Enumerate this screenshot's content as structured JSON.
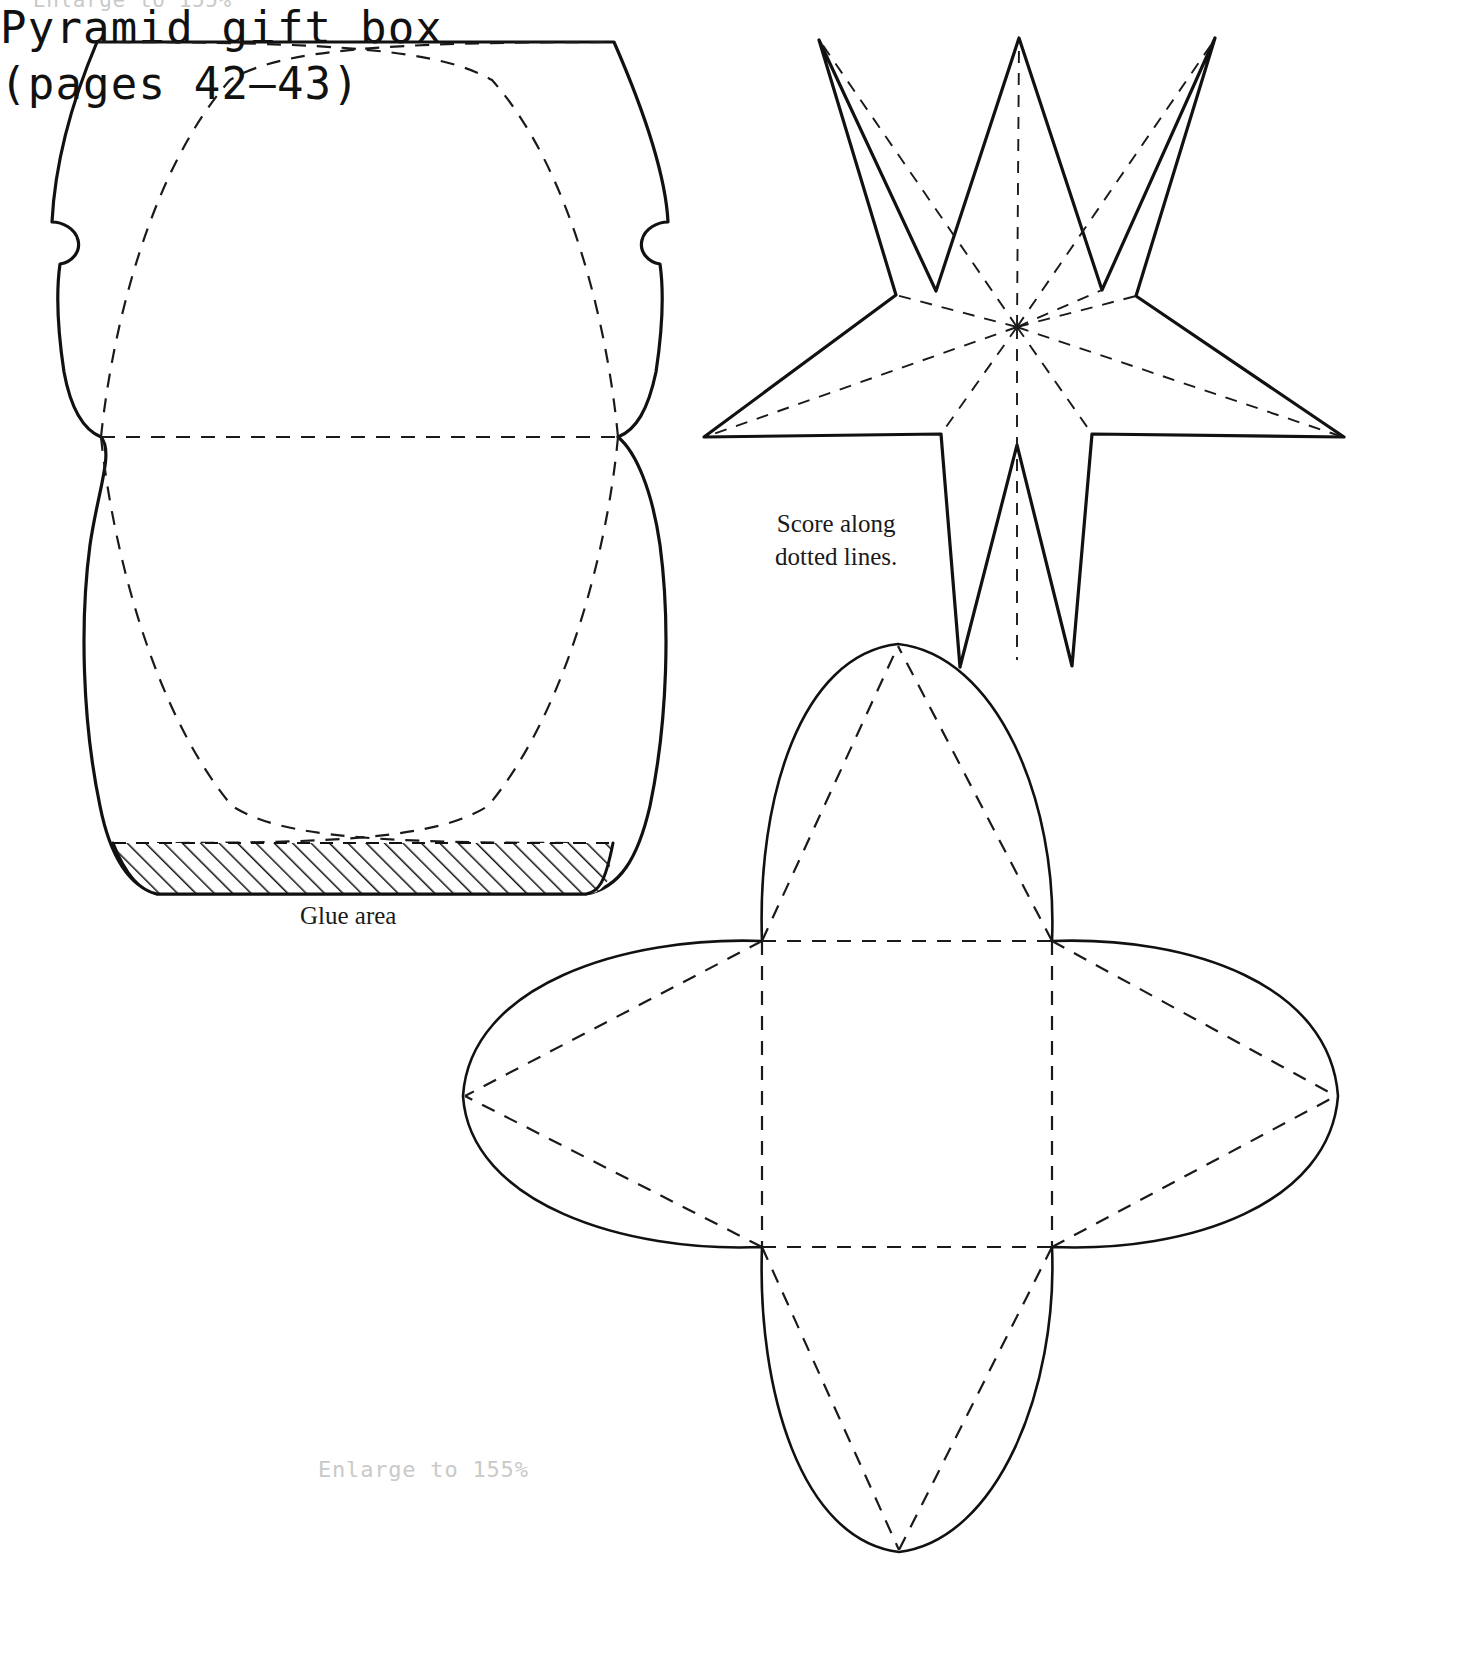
{
  "page": {
    "background_color": "#ffffff",
    "ink_color": "#111111",
    "hint_color": "#c9c9c9",
    "width": 1480,
    "height": 1662
  },
  "notes": {
    "enlarge_top": "Enlarge to 155%",
    "enlarge_bottom": "Enlarge to 155%",
    "score_instruction": "Score along\ndotted lines.",
    "glue_area": "Glue area"
  },
  "title_block": {
    "title": "Pyramid gift box",
    "pages": "(pages 42–43)"
  },
  "templates": [
    {
      "name": "pillow-box-template",
      "label": "Pillow box",
      "line_types": [
        "cut",
        "score"
      ],
      "features": [
        "curved top edge",
        "curved bottom edge",
        "side notches",
        "centre fold line",
        "glue flap"
      ]
    },
    {
      "name": "star-template",
      "label": "Five-pointed star",
      "points": 5,
      "line_types": [
        "cut",
        "score"
      ],
      "features": [
        "score lines from centre to each tip",
        "score lines from centre to each inner vertex"
      ]
    },
    {
      "name": "pyramid-box-template",
      "label": "Pyramid gift box net",
      "line_types": [
        "cut",
        "score"
      ],
      "features": [
        "square base scored",
        "four petal flaps",
        "diagonal score lines"
      ]
    }
  ],
  "legend": {
    "cut_line": "solid line",
    "score_line": "dotted line",
    "glue_hatch": "diagonal hatching"
  }
}
